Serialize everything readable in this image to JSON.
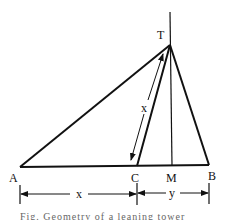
{
  "figure": {
    "points": {
      "T": {
        "label": "T",
        "x": 170,
        "y": 45
      },
      "A": {
        "label": "A",
        "x": 20,
        "y": 167
      },
      "C": {
        "label": "C",
        "x": 137,
        "y": 166
      },
      "M": {
        "label": "M",
        "x": 172,
        "y": 166
      },
      "B": {
        "label": "B",
        "x": 209,
        "y": 165
      }
    },
    "segment_labels": {
      "tc_length": "x",
      "ac_length": "x",
      "cb_length": "y"
    },
    "line_color": "#111111",
    "caption": "Fig. Geometry of a leaning tower problem"
  }
}
